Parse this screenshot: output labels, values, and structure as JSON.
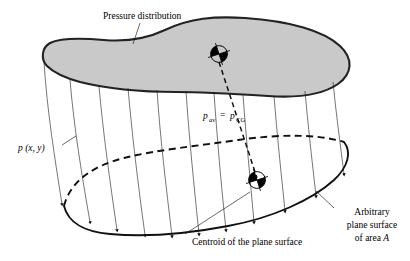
{
  "figure": {
    "background_color": "#ffffff",
    "line_color": "#111111",
    "blob_fill_color": "#c9c9c9",
    "blob_stroke_color": "#222222"
  },
  "labels": {
    "pressure_distribution": "Pressure distribution",
    "pressure_field": "p (x, y)",
    "p_av_symbol": "p",
    "p_av_subscript": "av",
    "equals": "=",
    "p_cg_symbol": "p",
    "p_cg_subscript": "CG",
    "centroid_caption": "Centroid of the plane surface",
    "arbitrary_line1": "Arbitrary",
    "arbitrary_line2": "plane surface",
    "arbitrary_line3_prefix": "of area ",
    "arbitrary_line3_area": "A"
  },
  "geometry": {
    "pressure_line_count": 11,
    "centroid_markers": 2,
    "arrowhead_count": 11
  }
}
